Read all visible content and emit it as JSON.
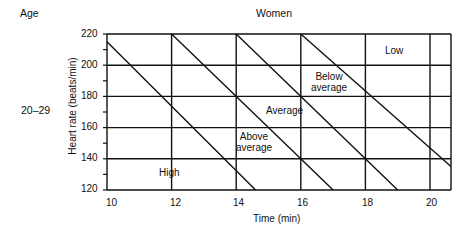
{
  "header": {
    "age_label": "Age",
    "group_label": "Women",
    "age_range": "20–29"
  },
  "chart_data": {
    "type": "line",
    "title": "Women",
    "row_label": "Age 20–29",
    "xlabel": "Time (min)",
    "ylabel": "Heart rate (beats/min)",
    "xlim": [
      10,
      20.65
    ],
    "ylim": [
      120,
      220
    ],
    "x_ticks": [
      10,
      12,
      14,
      16,
      18,
      20
    ],
    "y_ticks": [
      120,
      140,
      160,
      180,
      200,
      220
    ],
    "y_minor_step": 10,
    "grid": true,
    "series": [
      {
        "name": "High / Above average boundary",
        "x": [
          10,
          14.6
        ],
        "y": [
          215,
          120
        ]
      },
      {
        "name": "Above average / Average boundary",
        "x": [
          12,
          17
        ],
        "y": [
          220,
          120
        ]
      },
      {
        "name": "Average / Below average boundary",
        "x": [
          14,
          19
        ],
        "y": [
          220,
          120
        ]
      },
      {
        "name": "Below average / Low boundary",
        "x": [
          16,
          20.65
        ],
        "y": [
          220,
          135
        ]
      }
    ],
    "zones": [
      {
        "label": "High",
        "x": 12.1,
        "y": 130
      },
      {
        "label": "Above average",
        "x": 14.6,
        "y": 150
      },
      {
        "label": "Average",
        "x": 15.5,
        "y": 169
      },
      {
        "label": "Below average",
        "x": 17.1,
        "y": 192
      },
      {
        "label": "Low",
        "x": 19.2,
        "y": 211
      }
    ]
  },
  "labels": {
    "x_ticks": [
      "10",
      "12",
      "14",
      "16",
      "18",
      "20"
    ],
    "y_ticks": [
      "220",
      "200",
      "180",
      "160",
      "140",
      "120"
    ],
    "zone_high": "High",
    "zone_above_1": "Above",
    "zone_above_2": "average",
    "zone_average": "Average",
    "zone_below_1": "Below",
    "zone_below_2": "average",
    "zone_low": "Low"
  },
  "colors": {
    "line": "#111111",
    "background": "#ffffff"
  }
}
